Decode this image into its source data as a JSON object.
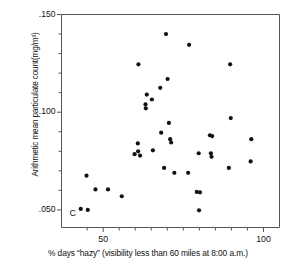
{
  "figure": {
    "panel_letter": "C",
    "background_color": "#ffffff",
    "point_color": "#111111",
    "axis_color": "#555555"
  },
  "chart_data": {
    "type": "scatter",
    "title": "",
    "xlabel": "% days “hazy” (visibility less than 60 miles at 8:00 a.m.)",
    "ylabel": "Arithmetic mean particulate count(mg/m³)",
    "xlim": [
      37,
      105
    ],
    "ylim": [
      0.041,
      0.15
    ],
    "xticks": [
      50,
      100
    ],
    "xtick_labels": [
      "50",
      "100"
    ],
    "xminor_ticks": [
      45,
      55,
      60,
      65,
      70,
      75,
      80,
      85,
      90,
      95
    ],
    "yticks": [
      0.05,
      0.1,
      0.15
    ],
    "ytick_labels": [
      ".050",
      ".100",
      ".150"
    ],
    "yminor_ticks": [
      0.06,
      0.07,
      0.08,
      0.09,
      0.11,
      0.12,
      0.13,
      0.14
    ],
    "grid": false,
    "legend": null,
    "points": [
      {
        "x": 43.0,
        "y": 0.0505
      },
      {
        "x": 44.8,
        "y": 0.0675
      },
      {
        "x": 45.2,
        "y": 0.05
      },
      {
        "x": 47.6,
        "y": 0.0605
      },
      {
        "x": 51.5,
        "y": 0.0605
      },
      {
        "x": 55.8,
        "y": 0.057
      },
      {
        "x": 59.8,
        "y": 0.0785
      },
      {
        "x": 60.8,
        "y": 0.084
      },
      {
        "x": 60.9,
        "y": 0.08
      },
      {
        "x": 61.5,
        "y": 0.0778
      },
      {
        "x": 61.0,
        "y": 0.1245
      },
      {
        "x": 63.6,
        "y": 0.109
      },
      {
        "x": 63.2,
        "y": 0.104
      },
      {
        "x": 63.3,
        "y": 0.102
      },
      {
        "x": 65.2,
        "y": 0.1065
      },
      {
        "x": 65.5,
        "y": 0.0805
      },
      {
        "x": 67.8,
        "y": 0.1125
      },
      {
        "x": 68.1,
        "y": 0.0895
      },
      {
        "x": 69.6,
        "y": 0.14
      },
      {
        "x": 70.1,
        "y": 0.117
      },
      {
        "x": 70.5,
        "y": 0.0945
      },
      {
        "x": 70.9,
        "y": 0.0862
      },
      {
        "x": 71.2,
        "y": 0.0845
      },
      {
        "x": 69.0,
        "y": 0.0715
      },
      {
        "x": 72.2,
        "y": 0.069
      },
      {
        "x": 76.8,
        "y": 0.1345
      },
      {
        "x": 76.5,
        "y": 0.069
      },
      {
        "x": 79.8,
        "y": 0.079
      },
      {
        "x": 79.2,
        "y": 0.0592
      },
      {
        "x": 80.2,
        "y": 0.059
      },
      {
        "x": 79.9,
        "y": 0.0498
      },
      {
        "x": 83.3,
        "y": 0.0882
      },
      {
        "x": 84.0,
        "y": 0.0878
      },
      {
        "x": 83.6,
        "y": 0.079
      },
      {
        "x": 83.8,
        "y": 0.0772
      },
      {
        "x": 89.6,
        "y": 0.1245
      },
      {
        "x": 89.8,
        "y": 0.097
      },
      {
        "x": 89.2,
        "y": 0.0715
      },
      {
        "x": 96.2,
        "y": 0.0862
      },
      {
        "x": 96.0,
        "y": 0.0748
      }
    ]
  }
}
